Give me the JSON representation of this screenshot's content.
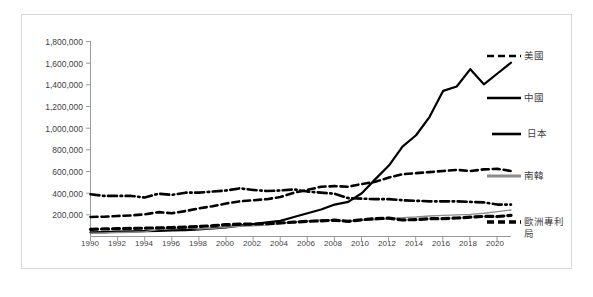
{
  "chart_data": {
    "type": "line",
    "title": "",
    "subtitle": "",
    "xlabel": "",
    "ylabel": "",
    "grid": false,
    "legend_position": "right",
    "ylim": [
      0,
      1800000
    ],
    "xlim": [
      1990,
      2021
    ],
    "y_ticks": [
      200000,
      400000,
      600000,
      800000,
      1000000,
      1200000,
      1400000,
      1600000,
      1800000
    ],
    "y_tick_labels": [
      "200,000",
      "400,000",
      "600,000",
      "800,000",
      "1,000,000",
      "1,200,000",
      "1,400,000",
      "1,600,000",
      "1,800,000"
    ],
    "x_tick_labels": [
      "1990",
      "1992",
      "1994",
      "1996",
      "1998",
      "2000",
      "2002",
      "2004",
      "2006",
      "2008",
      "2010",
      "2012",
      "2014",
      "2016",
      "2018",
      "2020"
    ],
    "x": [
      1990,
      1991,
      1992,
      1993,
      1994,
      1995,
      1996,
      1997,
      1998,
      1999,
      2000,
      2001,
      2002,
      2003,
      2004,
      2005,
      2006,
      2007,
      2008,
      2009,
      2010,
      2011,
      2012,
      2013,
      2014,
      2015,
      2016,
      2017,
      2018,
      2019,
      2020,
      2021
    ],
    "series": [
      {
        "name": "美國",
        "style": "dashed",
        "color": "#000000",
        "width": 2.6,
        "values": [
          176000,
          178000,
          185000,
          190000,
          200000,
          220000,
          210000,
          230000,
          255000,
          275000,
          300000,
          320000,
          330000,
          340000,
          360000,
          400000,
          425000,
          455000,
          460000,
          455000,
          480000,
          500000,
          540000,
          570000,
          580000,
          590000,
          600000,
          610000,
          600000,
          615000,
          620000,
          600000
        ]
      },
      {
        "name": "中國",
        "style": "solid",
        "color": "#000000",
        "width": 2.2,
        "values": [
          33000,
          36000,
          40000,
          42000,
          45000,
          47000,
          52000,
          55000,
          60000,
          70000,
          80000,
          95000,
          110000,
          125000,
          140000,
          175000,
          210000,
          245000,
          290000,
          315000,
          395000,
          525000,
          650000,
          825000,
          930000,
          1100000,
          1340000,
          1380000,
          1540000,
          1400000,
          1500000,
          1600000
        ]
      },
      {
        "name": "日本",
        "style": "dashdot",
        "color": "#000000",
        "width": 2.6,
        "values": [
          385000,
          370000,
          370000,
          370000,
          355000,
          390000,
          380000,
          400000,
          400000,
          410000,
          420000,
          440000,
          425000,
          415000,
          420000,
          430000,
          410000,
          400000,
          390000,
          350000,
          345000,
          340000,
          340000,
          330000,
          325000,
          320000,
          320000,
          320000,
          315000,
          310000,
          290000,
          290000
        ]
      },
      {
        "name": "南韓",
        "style": "solid",
        "color": "#8c8c8c",
        "width": 1.4,
        "values": [
          25000,
          28000,
          32000,
          35000,
          40000,
          60000,
          70000,
          75000,
          65000,
          70000,
          80000,
          90000,
          95000,
          100000,
          115000,
          130000,
          140000,
          150000,
          145000,
          135000,
          145000,
          150000,
          160000,
          170000,
          175000,
          185000,
          190000,
          195000,
          200000,
          210000,
          225000,
          240000
        ]
      },
      {
        "name": "歐洲專利局",
        "style": "dashed-thick",
        "color": "#000000",
        "width": 3.2,
        "values": [
          62000,
          65000,
          68000,
          70000,
          72000,
          75000,
          78000,
          82000,
          88000,
          95000,
          105000,
          110000,
          110000,
          115000,
          120000,
          128000,
          135000,
          140000,
          146000,
          135000,
          150000,
          160000,
          165000,
          148000,
          152000,
          160000,
          160000,
          166000,
          174000,
          181000,
          180000,
          190000
        ]
      }
    ]
  },
  "legend": {
    "items": [
      {
        "label": "美國",
        "marker": "dashed-line-marker"
      },
      {
        "label": "中國",
        "marker": "solid-line-marker"
      },
      {
        "label": "日本",
        "marker": "solid-line-marker"
      },
      {
        "label": "南韓",
        "marker": "gray-line-marker"
      },
      {
        "label": "歐洲專利局",
        "marker": "thick-dashed-line-marker"
      }
    ]
  }
}
